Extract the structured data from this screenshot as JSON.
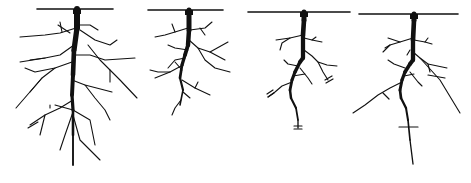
{
  "figure": {
    "width": 471,
    "height": 183,
    "stroke_color": "#111111",
    "thin_color": "#555555",
    "panels": [
      {
        "name": "root-system-1-dense",
        "soil_line": [
          37,
          9,
          113,
          9
        ],
        "taproot": [
          [
            77,
            9
          ],
          [
            77,
            28
          ],
          [
            74,
            50
          ],
          [
            73,
            75
          ],
          [
            72,
            95
          ],
          [
            73,
            110
          ],
          [
            73,
            135
          ],
          [
            73,
            165
          ]
        ],
        "taproot_width": 6,
        "branches": [
          [
            [
              76,
              28
            ],
            [
              60,
              33
            ],
            [
              45,
              35
            ],
            [
              20,
              37
            ]
          ],
          [
            [
              70,
              33
            ],
            [
              58,
              25
            ]
          ],
          [
            [
              62,
              32
            ],
            [
              60,
              22
            ]
          ],
          [
            [
              77,
              25
            ],
            [
              90,
              25
            ],
            [
              98,
              30
            ]
          ],
          [
            [
              80,
              30
            ],
            [
              95,
              40
            ],
            [
              110,
              45
            ],
            [
              117,
              40
            ]
          ],
          [
            [
              74,
              45
            ],
            [
              60,
              55
            ],
            [
              45,
              58
            ],
            [
              30,
              60
            ]
          ],
          [
            [
              45,
              58
            ],
            [
              20,
              62
            ]
          ],
          [
            [
              73,
              55
            ],
            [
              90,
              55
            ],
            [
              105,
              60
            ],
            [
              135,
              58
            ]
          ],
          [
            [
              88,
              45
            ],
            [
              100,
              60
            ],
            [
              110,
              70
            ],
            [
              120,
              80
            ],
            [
              137,
              98
            ]
          ],
          [
            [
              110,
              70
            ],
            [
              110,
              82
            ]
          ],
          [
            [
              72,
              62
            ],
            [
              55,
              68
            ],
            [
              35,
              72
            ],
            [
              25,
              68
            ]
          ],
          [
            [
              55,
              68
            ],
            [
              42,
              78
            ],
            [
              30,
              92
            ]
          ],
          [
            [
              42,
              78
            ],
            [
              16,
              108
            ]
          ],
          [
            [
              72,
              80
            ],
            [
              85,
              85
            ],
            [
              112,
              92
            ]
          ],
          [
            [
              85,
              85
            ],
            [
              95,
              98
            ],
            [
              105,
              110
            ],
            [
              110,
              120
            ]
          ],
          [
            [
              73,
              100
            ],
            [
              60,
              108
            ],
            [
              45,
              115
            ],
            [
              30,
              125
            ]
          ],
          [
            [
              45,
              115
            ],
            [
              40,
              135
            ]
          ],
          [
            [
              50,
              108
            ],
            [
              50,
              105
            ]
          ],
          [
            [
              73,
              110
            ],
            [
              55,
              105
            ]
          ],
          [
            [
              73,
              110
            ],
            [
              90,
              120
            ],
            [
              95,
              145
            ]
          ],
          [
            [
              73,
              115
            ],
            [
              80,
              140
            ],
            [
              100,
              160
            ]
          ],
          [
            [
              73,
              112
            ],
            [
              65,
              135
            ],
            [
              60,
              150
            ]
          ],
          [
            [
              38,
              122
            ],
            [
              28,
              128
            ]
          ]
        ]
      },
      {
        "name": "root-system-2-medium",
        "soil_line": [
          148,
          10,
          223,
          10
        ],
        "taproot": [
          [
            189,
            10
          ],
          [
            189,
            30
          ],
          [
            188,
            45
          ],
          [
            185,
            55
          ],
          [
            182,
            65
          ],
          [
            180,
            78
          ],
          [
            183,
            90
          ],
          [
            180,
            105
          ]
        ],
        "taproot_width": 5,
        "branches": [
          [
            [
              188,
              28
            ],
            [
              175,
              32
            ],
            [
              165,
              35
            ],
            [
              155,
              37
            ]
          ],
          [
            [
              175,
              32
            ],
            [
              172,
              24
            ]
          ],
          [
            [
              190,
              30
            ],
            [
              205,
              28
            ],
            [
              212,
              22
            ]
          ],
          [
            [
              200,
              28
            ],
            [
              205,
              35
            ]
          ],
          [
            [
              189,
              40
            ],
            [
              198,
              48
            ],
            [
              210,
              52
            ],
            [
              228,
              42
            ]
          ],
          [
            [
              210,
              52
            ],
            [
              225,
              60
            ]
          ],
          [
            [
              198,
              48
            ],
            [
              205,
              60
            ],
            [
              215,
              68
            ],
            [
              230,
              72
            ]
          ],
          [
            [
              188,
              50
            ],
            [
              175,
              48
            ],
            [
              168,
              45
            ]
          ],
          [
            [
              185,
              58
            ],
            [
              175,
              60
            ],
            [
              168,
              68
            ]
          ],
          [
            [
              183,
              65
            ],
            [
              170,
              72
            ],
            [
              158,
              72
            ],
            [
              150,
              70
            ]
          ],
          [
            [
              170,
              72
            ],
            [
              155,
              78
            ]
          ],
          [
            [
              182,
              70
            ],
            [
              175,
              62
            ]
          ],
          [
            [
              182,
              80
            ],
            [
              195,
              88
            ],
            [
              210,
              95
            ]
          ],
          [
            [
              195,
              88
            ],
            [
              198,
              82
            ]
          ],
          [
            [
              181,
              100
            ],
            [
              175,
              108
            ],
            [
              172,
              115
            ]
          ],
          [
            [
              183,
              92
            ],
            [
              190,
              98
            ]
          ]
        ]
      },
      {
        "name": "root-system-3-truncated",
        "soil_line": [
          248,
          12,
          350,
          12
        ],
        "taproot": [
          [
            304,
            12
          ],
          [
            304,
            20
          ],
          [
            303,
            35
          ],
          [
            303,
            58
          ],
          [
            300,
            62
          ],
          [
            295,
            72
          ],
          [
            292,
            80
          ],
          [
            290,
            90
          ],
          [
            291,
            98
          ],
          [
            296,
            108
          ],
          [
            298,
            120
          ],
          [
            298,
            128
          ]
        ],
        "taproot_width": 5,
        "branches": [
          [
            [
              303,
              35
            ],
            [
              290,
              38
            ],
            [
              282,
              43
            ],
            [
              280,
              50
            ]
          ],
          [
            [
              290,
              38
            ],
            [
              276,
              40
            ]
          ],
          [
            [
              304,
              38
            ],
            [
              312,
              40
            ],
            [
              322,
              42
            ]
          ],
          [
            [
              312,
              40
            ],
            [
              316,
              37
            ]
          ],
          [
            [
              304,
              50
            ],
            [
              312,
              56
            ],
            [
              318,
              62
            ],
            [
              327,
              65
            ],
            [
              337,
              66
            ]
          ],
          [
            [
              318,
              62
            ],
            [
              323,
              72
            ],
            [
              328,
              80
            ]
          ],
          [
            [
              298,
              66
            ],
            [
              288,
              64
            ],
            [
              284,
              60
            ]
          ],
          [
            [
              300,
              68
            ],
            [
              308,
              78
            ],
            [
              312,
              84
            ]
          ],
          [
            [
              292,
              82
            ],
            [
              282,
              86
            ],
            [
              275,
              92
            ],
            [
              268,
              97
            ]
          ],
          [
            [
              293,
              76
            ],
            [
              305,
              74
            ]
          ]
        ],
        "cut_marks": [
          [
            [
              325,
              80
            ],
            [
              332,
              76
            ]
          ],
          [
            [
              326,
              83
            ],
            [
              333,
              79
            ]
          ],
          [
            [
              267,
              94
            ],
            [
              273,
              90
            ]
          ],
          [
            [
              268,
              97
            ],
            [
              274,
              93
            ]
          ],
          [
            [
              294,
              126
            ],
            [
              302,
              126
            ]
          ],
          [
            [
              294,
              129
            ],
            [
              302,
              129
            ]
          ]
        ]
      },
      {
        "name": "root-system-4-crossed",
        "soil_line": [
          359,
          14,
          458,
          14
        ],
        "taproot": [
          [
            414,
            14
          ],
          [
            414,
            20
          ],
          [
            413,
            40
          ],
          [
            413,
            60
          ],
          [
            410,
            64
          ],
          [
            405,
            72
          ],
          [
            402,
            80
          ],
          [
            400,
            90
          ],
          [
            401,
            98
          ],
          [
            406,
            108
          ],
          [
            408,
            120
          ],
          [
            410,
            140
          ],
          [
            413,
            164
          ]
        ],
        "taproot_width": 5,
        "branches": [
          [
            [
              413,
              38
            ],
            [
              400,
              42
            ],
            [
              390,
              45
            ],
            [
              383,
              52
            ]
          ],
          [
            [
              400,
              42
            ],
            [
              388,
              38
            ]
          ],
          [
            [
              390,
              45
            ],
            [
              385,
              48
            ]
          ],
          [
            [
              414,
              40
            ],
            [
              425,
              42
            ],
            [
              432,
              44
            ]
          ],
          [
            [
              425,
              42
            ],
            [
              428,
              38
            ]
          ],
          [
            [
              413,
              52
            ],
            [
              420,
              58
            ],
            [
              428,
              64
            ],
            [
              447,
              68
            ]
          ],
          [
            [
              420,
              58
            ],
            [
              440,
              80
            ],
            [
              460,
              113
            ]
          ],
          [
            [
              428,
              64
            ],
            [
              430,
              72
            ]
          ],
          [
            [
              407,
              55
            ],
            [
              410,
              50
            ]
          ],
          [
            [
              405,
              68
            ],
            [
              394,
              64
            ],
            [
              388,
              60
            ]
          ],
          [
            [
              410,
              72
            ],
            [
              418,
              82
            ],
            [
              422,
              86
            ]
          ],
          [
            [
              402,
              82
            ],
            [
              390,
              88
            ],
            [
              378,
              95
            ],
            [
              365,
              105
            ],
            [
              353,
              113
            ]
          ],
          [
            [
              404,
              76
            ],
            [
              414,
              74
            ]
          ]
        ],
        "cut_marks": [
          [
            [
              428,
              75
            ],
            [
              445,
              78
            ]
          ],
          [
            [
              383,
              93
            ],
            [
              389,
              99
            ]
          ],
          [
            [
              399,
              127
            ],
            [
              418,
              127
            ]
          ]
        ]
      }
    ]
  }
}
